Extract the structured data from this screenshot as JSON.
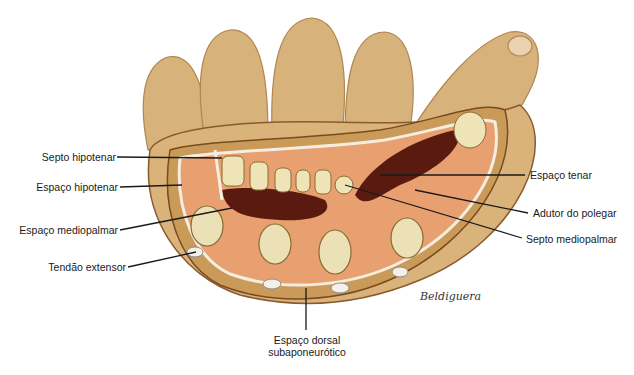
{
  "figure": {
    "signature": "Beldiguera",
    "labels": {
      "septo_hipotenar": "Septo hipotenar",
      "espaco_hipotenar": "Espaço hipotenar",
      "espaco_mediopalmar": "Espaço mediopalmar",
      "tendao_extensor": "Tendão extensor",
      "espaco_tenar": "Espaço tenar",
      "adutor_do_polegar": "Adutor do polegar",
      "septo_mediopalmar": "Septo mediopalmar",
      "espaco_dorsal_line1": "Espaço dorsal",
      "espaco_dorsal_line2": "subaponeurótico"
    },
    "colors": {
      "skin": "#d9b37a",
      "muscle": "#e8a070",
      "space": "#5a1a10",
      "tendon": "#efe3b8",
      "fascia": "#f4ede0",
      "leader": "#1a1a1a"
    }
  }
}
